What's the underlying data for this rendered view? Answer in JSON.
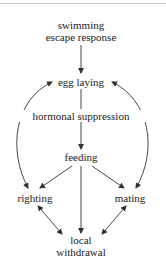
{
  "diagram": {
    "nodes": {
      "swimming": {
        "line1": "swimming",
        "line2": "escape response"
      },
      "egg_laying": {
        "label": "egg laying"
      },
      "hormonal": {
        "label": "hormonal suppression"
      },
      "feeding": {
        "label": "feeding"
      },
      "righting": {
        "label": "righting"
      },
      "mating": {
        "label": "mating"
      },
      "local": {
        "line1": "local",
        "line2": "withdrawal"
      }
    },
    "edges": [
      {
        "from": "swimming escape response",
        "to": "egg laying",
        "type": "directed"
      },
      {
        "from": "egg laying",
        "to": "feeding",
        "type": "directed",
        "label": "hormonal suppression"
      },
      {
        "from": "feeding",
        "to": "righting",
        "type": "directed"
      },
      {
        "from": "feeding",
        "to": "mating",
        "type": "directed"
      },
      {
        "from": "feeding",
        "to": "local withdrawal",
        "type": "directed"
      },
      {
        "from": "righting",
        "to": "egg laying",
        "type": "bidirectional"
      },
      {
        "from": "mating",
        "to": "egg laying",
        "type": "bidirectional"
      },
      {
        "from": "righting",
        "to": "local withdrawal",
        "type": "bidirectional"
      },
      {
        "from": "mating",
        "to": "local withdrawal",
        "type": "bidirectional"
      }
    ],
    "colors": {
      "line": "#333333",
      "text": "#222222",
      "background": "#ffffff"
    }
  }
}
